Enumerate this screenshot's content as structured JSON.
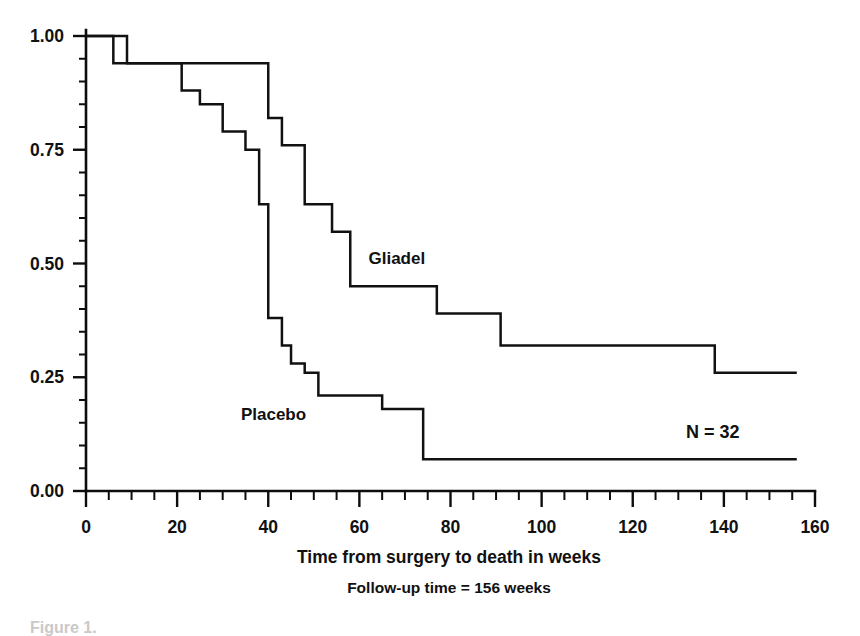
{
  "figure": {
    "caption": "Figure 1.",
    "annotation": "N = 32",
    "xlabel": "Time from surgery to death in weeks",
    "sublabel": "Follow-up time = 156 weeks"
  },
  "chart_data": {
    "type": "line",
    "title": "",
    "xlabel": "Time from surgery to death in weeks",
    "ylabel": "",
    "subtitle": "Follow-up time = 156 weeks",
    "annotations": [
      "N = 32"
    ],
    "xlim": [
      0,
      160
    ],
    "ylim": [
      0.0,
      1.0
    ],
    "grid": false,
    "legend_position": "inline-labels",
    "x_major_ticks": [
      0,
      20,
      40,
      60,
      80,
      100,
      120,
      140,
      160
    ],
    "x_minor_tick_step": 5,
    "y_major_ticks": [
      0.0,
      0.25,
      0.5,
      0.75,
      1.0
    ],
    "y_minor_tick_step": 0.05,
    "x_tick_labels": [
      "0",
      "20",
      "40",
      "60",
      "80",
      "100",
      "120",
      "140",
      "160"
    ],
    "y_tick_labels": [
      "0.00",
      "0.25",
      "0.50",
      "0.75",
      "1.00"
    ],
    "step_style": "post",
    "series": [
      {
        "name": "Gliadel",
        "label_x": 62,
        "label_y": 0.5,
        "x": [
          0,
          9,
          40,
          43,
          48,
          54,
          58,
          77,
          91,
          138,
          156
        ],
        "values": [
          1.0,
          1.0,
          0.94,
          0.82,
          0.76,
          0.63,
          0.57,
          0.45,
          0.39,
          0.32,
          0.26
        ],
        "steps": [
          {
            "time": 0,
            "survival": 1.0
          },
          {
            "time": 9,
            "survival": 0.94
          },
          {
            "time": 40,
            "survival": 0.82
          },
          {
            "time": 43,
            "survival": 0.76
          },
          {
            "time": 48,
            "survival": 0.63
          },
          {
            "time": 54,
            "survival": 0.57
          },
          {
            "time": 58,
            "survival": 0.45
          },
          {
            "time": 77,
            "survival": 0.39
          },
          {
            "time": 91,
            "survival": 0.32
          },
          {
            "time": 138,
            "survival": 0.26
          },
          {
            "time": 156,
            "survival": 0.26
          }
        ]
      },
      {
        "name": "Placebo",
        "label_x": 34,
        "label_y": 0.155,
        "x": [
          0,
          6,
          21,
          25,
          30,
          35,
          38,
          40,
          43,
          45,
          48,
          51,
          65,
          74,
          156
        ],
        "values": [
          1.0,
          0.94,
          0.88,
          0.85,
          0.79,
          0.75,
          0.63,
          0.38,
          0.32,
          0.28,
          0.26,
          0.21,
          0.18,
          0.07,
          0.07
        ],
        "steps": [
          {
            "time": 0,
            "survival": 1.0
          },
          {
            "time": 6,
            "survival": 0.94
          },
          {
            "time": 21,
            "survival": 0.88
          },
          {
            "time": 25,
            "survival": 0.85
          },
          {
            "time": 30,
            "survival": 0.79
          },
          {
            "time": 35,
            "survival": 0.75
          },
          {
            "time": 38,
            "survival": 0.63
          },
          {
            "time": 40,
            "survival": 0.38
          },
          {
            "time": 43,
            "survival": 0.32
          },
          {
            "time": 45,
            "survival": 0.28
          },
          {
            "time": 48,
            "survival": 0.26
          },
          {
            "time": 51,
            "survival": 0.21
          },
          {
            "time": 65,
            "survival": 0.18
          },
          {
            "time": 74,
            "survival": 0.07
          },
          {
            "time": 156,
            "survival": 0.07
          }
        ]
      }
    ]
  },
  "colors": {
    "curve": "#111111",
    "axis": "#0d0d0d",
    "text": "#111111",
    "background": "#ffffff"
  }
}
